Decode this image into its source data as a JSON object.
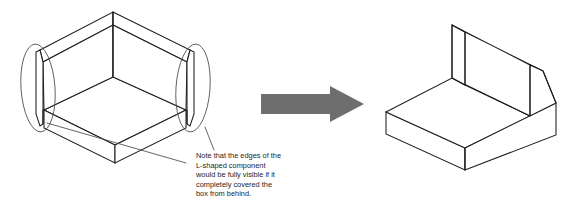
{
  "figure": {
    "background_color": "#ffffff",
    "line_color": "#1d1d1d",
    "callout_color": "#4a4a4a",
    "arrow_color": "#6e6e6e",
    "width": 581,
    "height": 205
  },
  "annotation": {
    "lines": [
      "Note that the edges of the",
      "L-shaped component",
      "would be fully visible if it",
      "completely covered the",
      "box from behind."
    ],
    "line_1": "Note that the edges of the",
    "line_2": "L-shaped component",
    "line_3": "would be fully visible if it",
    "line_4": "completely covered the",
    "line_5": "box from behind.",
    "full_text": "Note that the edges of the L-shaped component would be fully visible if it completely covered the box from behind."
  },
  "left_figure": {
    "name": "exploded-assembly",
    "parts": [
      {
        "name": "l-shaped-component",
        "description": "Open L-shaped wall panel seen from inside"
      },
      {
        "name": "box-slab",
        "description": "Rectangular box sitting inside the L-shaped component"
      }
    ],
    "callouts": [
      {
        "name": "left-edge-callout",
        "shape": "ellipse",
        "description": "Highlights the left end edge of the L-shaped component"
      },
      {
        "name": "right-edge-callout",
        "shape": "ellipse",
        "description": "Highlights the right end edge of the L-shaped component"
      }
    ]
  },
  "arrow": {
    "name": "transformation-arrow",
    "direction": "right",
    "color": "#6e6e6e"
  },
  "right_figure": {
    "name": "merged-solid",
    "description": "Resulting solid block with L-shaped notch in the top face"
  }
}
